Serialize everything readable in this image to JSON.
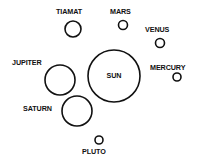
{
  "diagram": {
    "bodies": [
      {
        "name": "TIAMAT",
        "cx": 73,
        "cy": 29,
        "r": 8,
        "lx": 56,
        "ly": 14,
        "anchor": "start"
      },
      {
        "name": "MARS",
        "cx": 123,
        "cy": 25,
        "r": 4.5,
        "lx": 110,
        "ly": 14,
        "anchor": "start"
      },
      {
        "name": "VENUS",
        "cx": 160,
        "cy": 43,
        "r": 4.5,
        "lx": 145,
        "ly": 32,
        "anchor": "start"
      },
      {
        "name": "MERCURY",
        "cx": 177,
        "cy": 77,
        "r": 4,
        "lx": 150,
        "ly": 70,
        "anchor": "start"
      },
      {
        "name": "SUN",
        "cx": 114,
        "cy": 76,
        "r": 26,
        "lx": 114,
        "ly": 78,
        "anchor": "middle"
      },
      {
        "name": "JUPITER",
        "cx": 60,
        "cy": 80,
        "r": 15,
        "lx": 12,
        "ly": 65,
        "anchor": "start"
      },
      {
        "name": "SATURN",
        "cx": 77,
        "cy": 111,
        "r": 15,
        "lx": 23,
        "ly": 111,
        "anchor": "start"
      },
      {
        "name": "PLUTO",
        "cx": 99,
        "cy": 140,
        "r": 4,
        "lx": 82,
        "ly": 154,
        "anchor": "start"
      }
    ]
  }
}
